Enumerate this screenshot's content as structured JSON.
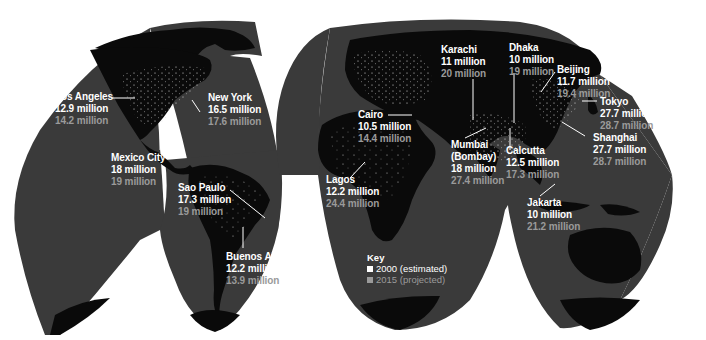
{
  "map": {
    "projection": "interrupted-homolosine",
    "colors": {
      "ocean": "#3a3a3a",
      "land": "#0a0a0a",
      "lights": "#e8e8e8",
      "background": "#ffffff",
      "label_2000": "#ffffff",
      "label_2015": "#9a9a9a"
    }
  },
  "cities": [
    {
      "name": "Los Angeles",
      "v2000": "12.9 million",
      "v2015": "14.2 million"
    },
    {
      "name": "New York",
      "v2000": "16.5 million",
      "v2015": "17.6 million"
    },
    {
      "name": "Mexico City",
      "v2000": "18 million",
      "v2015": "19 million"
    },
    {
      "name": "Sao Paulo",
      "v2000": "17.3 million",
      "v2015": "19 million"
    },
    {
      "name": "Buenos Aires",
      "v2000": "12.2 million",
      "v2015": "13.9 million"
    },
    {
      "name": "Cairo",
      "v2000": "10.5 million",
      "v2015": "14.4 million"
    },
    {
      "name": "Lagos",
      "v2000": "12.2 million",
      "v2015": "24.4 million"
    },
    {
      "name": "Karachi",
      "v2000": "11 million",
      "v2015": "20 million"
    },
    {
      "name": "Mumbai (Bombay)",
      "name_line1": "Mumbai",
      "name_line2": "(Bombay)",
      "v2000": "18 million",
      "v2015": "27.4 million"
    },
    {
      "name": "Dhaka",
      "v2000": "10 million",
      "v2015": "19 million"
    },
    {
      "name": "Calcutta",
      "v2000": "12.5 million",
      "v2015": "17.3 million"
    },
    {
      "name": "Beijing",
      "v2000": "11.7 million",
      "v2015": "19.4 million"
    },
    {
      "name": "Tokyo",
      "v2000": "27.7 million",
      "v2015": "28.7 million"
    },
    {
      "name": "Shanghai",
      "v2000": "27.7 million",
      "v2015": "28.7 million"
    },
    {
      "name": "Jakarta",
      "v2000": "10 million",
      "v2015": "21.2 million"
    }
  ],
  "key": {
    "title": "Key",
    "items": [
      {
        "label": "2000 (estimated)",
        "color": "#ffffff"
      },
      {
        "label": "2015 (projected)",
        "color": "#9a9a9a"
      }
    ]
  }
}
